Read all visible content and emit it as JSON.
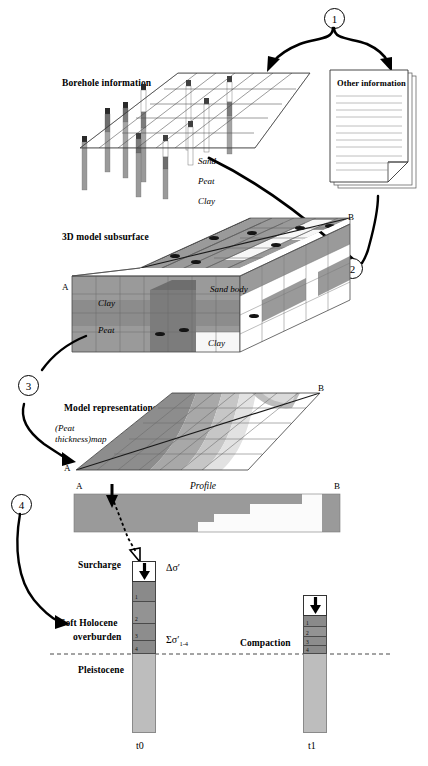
{
  "figure": {
    "steps": [
      {
        "id": "1",
        "label": "1"
      },
      {
        "id": "2",
        "label": "2"
      },
      {
        "id": "3",
        "label": "3"
      },
      {
        "id": "4",
        "label": "4"
      }
    ]
  },
  "stage_inputs": {
    "borehole_title": "Borehole information",
    "other_info_title": "Other information",
    "legend": [
      {
        "name": "sand",
        "label": "Sand",
        "color": "#ffffff"
      },
      {
        "name": "peat",
        "label": "Peat",
        "color": "#4f4f4f"
      },
      {
        "name": "clay",
        "label": "Clay",
        "color": "#9a9a9a"
      }
    ]
  },
  "stage_model3d": {
    "title": "3D model subsurface",
    "corner_a": "A",
    "corner_b": "B",
    "annotations": [
      {
        "name": "clay-upper",
        "label": "Clay"
      },
      {
        "name": "peat-middle",
        "label": "Peat"
      },
      {
        "name": "clay-lower",
        "label": "Clay"
      },
      {
        "name": "sand-body",
        "label": "Sand body"
      }
    ]
  },
  "stage_representations": {
    "title": "Model representations",
    "map_label_line1": "(Peat",
    "map_label_line2": "thickness)map",
    "corner_a": "A",
    "corner_b": "B",
    "profile_title": "Profile",
    "profile_corner_a": "A",
    "profile_corner_b": "B"
  },
  "stage_compaction": {
    "surcharge_label": "Surcharge",
    "delta_stress": "Δσ′",
    "overburden_line1": "Soft Holocene",
    "overburden_line2": "overburden",
    "sum_stress_main": "Σσ′",
    "sum_stress_sub": "1-4",
    "compaction_label": "Compaction",
    "pleistocene_label": "Pleistocene",
    "time_start": "t0",
    "time_end": "t1",
    "t0_segments": [
      "1",
      "2",
      "3",
      "4"
    ],
    "t1_segments": [
      "1",
      "2",
      "3",
      "4"
    ]
  },
  "colors": {
    "clay": "#9a9a9a",
    "peat": "#5a5a5a",
    "sand": "#fbfbfb",
    "pleistocene": "#bdbdbd",
    "holocene_dark": "#8c8c8c",
    "grid_line": "#555555",
    "ink": "#000000"
  }
}
